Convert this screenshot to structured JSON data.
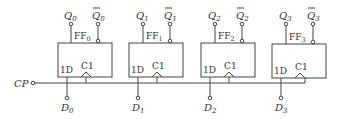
{
  "diagram": {
    "type": "circuit",
    "clock_label": "CP",
    "flip_flops": [
      {
        "name": "FF",
        "sub": "0",
        "q": "Q",
        "q_sub": "0",
        "qbar": "Q",
        "qbar_sub": "0",
        "d_label": "1D",
        "clk_label": "C1",
        "input": "D",
        "input_sub": "0"
      },
      {
        "name": "FF",
        "sub": "1",
        "q": "Q",
        "q_sub": "1",
        "qbar": "Q",
        "qbar_sub": "1",
        "d_label": "1D",
        "clk_label": "C1",
        "input": "D",
        "input_sub": "1"
      },
      {
        "name": "FF",
        "sub": "2",
        "q": "Q",
        "q_sub": "2",
        "qbar": "Q",
        "qbar_sub": "2",
        "d_label": "1D",
        "clk_label": "C1",
        "input": "D",
        "input_sub": "2"
      },
      {
        "name": "FF",
        "sub": "3",
        "q": "Q",
        "q_sub": "3",
        "qbar": "Q",
        "qbar_sub": "3",
        "d_label": "1D",
        "clk_label": "C1",
        "input": "D",
        "input_sub": "3"
      }
    ]
  }
}
